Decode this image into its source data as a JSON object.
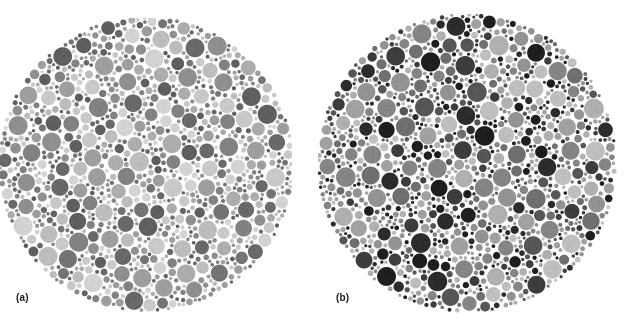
{
  "figure": {
    "kind": "ishihara-color-vision-test-plates",
    "background_color": "#ffffff",
    "width": 624,
    "height": 329,
    "panels": [
      {
        "id": "a",
        "caption": "(a)",
        "caption_x": 16,
        "caption_y": 292,
        "center_x": 146,
        "center_y": 164,
        "radius": 148,
        "clip_top": 18,
        "clip_bottom": 313,
        "clip_left": 0,
        "clip_right": 292,
        "contrast": "low",
        "dot_palette": [
          "#c9c9c9",
          "#d3d3d3",
          "#bdbdbd",
          "#adadad",
          "#9e9e9e",
          "#8f8f8f",
          "#828282",
          "#747474",
          "#696969",
          "#5f5f5f"
        ],
        "dot_weights": [
          9,
          8,
          9,
          10,
          11,
          11,
          11,
          10,
          11,
          10
        ],
        "dot_min_radius": 1.6,
        "dot_max_radius": 9.6,
        "gap": 0.7,
        "seed": 20731
      },
      {
        "id": "b",
        "caption": "(b)",
        "caption_x": 336,
        "caption_y": 292,
        "center_x": 467,
        "center_y": 163,
        "radius": 150,
        "clip_top": 14,
        "clip_bottom": 313,
        "clip_left": 318,
        "clip_right": 618,
        "contrast": "high",
        "dot_palette": [
          "#bfbfbf",
          "#b0b0b0",
          "#a1a1a1",
          "#939393",
          "#858585",
          "#6f6f6f",
          "#565656",
          "#3d3d3d",
          "#2c2c2c",
          "#1f1f1f"
        ],
        "dot_weights": [
          9,
          10,
          10,
          10,
          10,
          10,
          9,
          11,
          11,
          10
        ],
        "dot_min_radius": 1.5,
        "dot_max_radius": 9.9,
        "gap": 0.7,
        "seed": 48219
      }
    ]
  },
  "captions": {
    "panel_a_label": "(a)",
    "panel_b_label": "(b)"
  }
}
